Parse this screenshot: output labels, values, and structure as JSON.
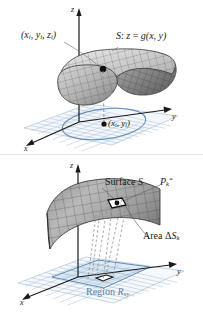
{
  "figure_top": {
    "name": "saddle-surface-with-sample-point",
    "axes": {
      "x": "x",
      "y": "y",
      "z": "z"
    },
    "labels": {
      "sample_point_3d_prefix": "(",
      "sample_point_3d": "x",
      "surface_equation_lead": "S",
      "surface_equation_colon": ": ",
      "surface_equation_z": "z",
      "surface_equation_eq": " = ",
      "surface_equation_g": "g",
      "surface_equation_args": "(x, y)",
      "sample_point_3d_full": "(xi, yi, zi)",
      "sample_point_2d_full": "(xi, yi)"
    },
    "point_3d": {
      "open": "(",
      "x": "x",
      "xsub": "i",
      "c1": ", ",
      "y": "y",
      "ysub": "i",
      "c2": ", ",
      "z": "z",
      "zsub": "i",
      "close": ")"
    },
    "point_2d": {
      "open": "(",
      "x": "x",
      "xsub": "i",
      "c1": ", ",
      "y": "y",
      "ysub": "i",
      "close": ")"
    },
    "surface_eq": {
      "s": "S",
      "colon": ": ",
      "z": "z",
      "eq": " = ",
      "g": "g",
      "args": "(x, y)"
    }
  },
  "figure_bottom": {
    "name": "surface-patch-projection",
    "axes": {
      "x": "x",
      "y": "y",
      "z": "z"
    },
    "surface_label": {
      "word": "Surface",
      "space": " ",
      "s": "S"
    },
    "point_star": {
      "p": "P",
      "sub": "k",
      "star": "*"
    },
    "area_label": {
      "word": "Area",
      "space": " ",
      "delta": "Δ",
      "s": "S",
      "sub": "k"
    },
    "region_label": {
      "word": "Region",
      "space": " ",
      "r": "R",
      "sub": "xy"
    }
  },
  "colors": {
    "surface_mesh_dark": "#4a4a4a",
    "surface_fill_light": "#d2d2d2",
    "surface_fill_mid": "#a8a8a8",
    "surface_fill_dark": "#6e6e6e",
    "plane_grid_blue": "#9fb8d0",
    "region_blue": "#cfe0ef",
    "region_stroke_blue": "#4f7fae",
    "axis_black": "#1a1a1a",
    "label_blue": "#5b7fa6",
    "background": "#ffffff"
  }
}
